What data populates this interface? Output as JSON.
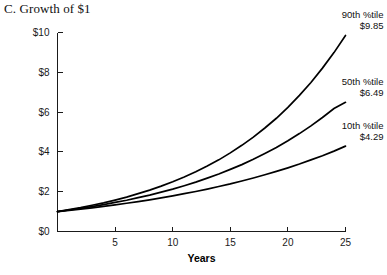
{
  "chart_data": {
    "type": "line",
    "title": "C. Growth of $1",
    "xlabel": "Years",
    "ylabel": "",
    "xlim": [
      0,
      25
    ],
    "ylim": [
      0,
      10
    ],
    "grid": false,
    "legend_position": "inline-end-of-line",
    "x_ticks": [
      {
        "value": 5,
        "label": "5"
      },
      {
        "value": 10,
        "label": "10"
      },
      {
        "value": 15,
        "label": "15"
      },
      {
        "value": 20,
        "label": "20"
      },
      {
        "value": 25,
        "label": "25"
      }
    ],
    "y_ticks": [
      {
        "value": 0,
        "label": "$0"
      },
      {
        "value": 2,
        "label": "$2"
      },
      {
        "value": 4,
        "label": "$4"
      },
      {
        "value": 6,
        "label": "$6"
      },
      {
        "value": 8,
        "label": "$8"
      },
      {
        "value": 10,
        "label": "$10"
      }
    ],
    "x": [
      0,
      1,
      2,
      3,
      4,
      5,
      6,
      7,
      8,
      9,
      10,
      11,
      12,
      13,
      14,
      15,
      16,
      17,
      18,
      19,
      20,
      21,
      22,
      23,
      24,
      25
    ],
    "series": [
      {
        "name": "90th %tile",
        "end_label": "$9.85",
        "end_value": 9.85,
        "start_value": 1,
        "values": [
          1.0,
          1.1,
          1.2,
          1.32,
          1.44,
          1.58,
          1.73,
          1.9,
          2.08,
          2.28,
          2.5,
          2.74,
          3.0,
          3.29,
          3.6,
          3.95,
          4.33,
          4.74,
          5.2,
          5.69,
          6.24,
          6.84,
          7.49,
          8.21,
          8.99,
          9.85
        ]
      },
      {
        "name": "50th %tile",
        "end_label": "$6.49",
        "end_value": 6.49,
        "start_value": 1,
        "values": [
          1.0,
          1.08,
          1.16,
          1.25,
          1.35,
          1.46,
          1.57,
          1.7,
          1.83,
          1.98,
          2.13,
          2.3,
          2.48,
          2.68,
          2.89,
          3.12,
          3.36,
          3.63,
          3.92,
          4.22,
          4.56,
          4.92,
          5.31,
          5.73,
          6.18,
          6.49
        ]
      },
      {
        "name": "10th %tile",
        "end_label": "$4.29",
        "end_value": 4.29,
        "start_value": 1,
        "values": [
          1.0,
          1.06,
          1.12,
          1.19,
          1.26,
          1.34,
          1.42,
          1.5,
          1.59,
          1.69,
          1.79,
          1.9,
          2.01,
          2.13,
          2.26,
          2.39,
          2.54,
          2.69,
          2.85,
          3.02,
          3.2,
          3.39,
          3.6,
          3.81,
          4.04,
          4.29
        ]
      }
    ],
    "annotations": [
      {
        "series": "90th %tile",
        "line1": "90th %tile",
        "line2": "$9.85"
      },
      {
        "series": "50th %tile",
        "line1": "50th %tile",
        "line2": "$6.49"
      },
      {
        "series": "10th %tile",
        "line1": "10th %tile",
        "line2": "$4.29"
      }
    ]
  },
  "colors": {
    "curve": "#000000",
    "axis": "#1a1a1a",
    "text": "#101010",
    "background": "#ffffff"
  }
}
